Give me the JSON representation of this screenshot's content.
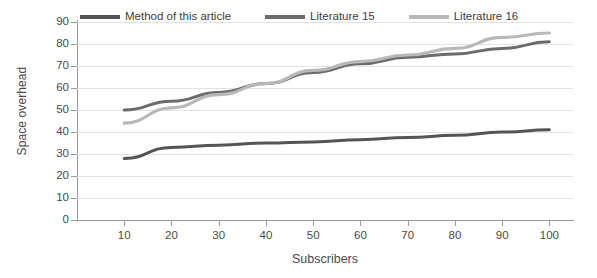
{
  "chart_data": {
    "type": "line",
    "title": "",
    "xlabel": "Subscribers",
    "ylabel": "Space overhead",
    "xlim": [
      0,
      105
    ],
    "ylim": [
      0,
      90
    ],
    "grid": true,
    "legend_position": "top",
    "x": [
      10,
      20,
      30,
      40,
      50,
      60,
      70,
      80,
      90,
      100
    ],
    "xticks": [
      "10",
      "20",
      "30",
      "40",
      "50",
      "60",
      "70",
      "80",
      "90",
      "100"
    ],
    "yticks": [
      "0",
      "10",
      "20",
      "30",
      "40",
      "50",
      "60",
      "70",
      "80",
      "90"
    ],
    "series": [
      {
        "name": "Method of this article",
        "color": "#545454",
        "values": [
          28,
          33,
          34,
          35,
          35.5,
          36.5,
          37.5,
          38.5,
          40,
          41
        ]
      },
      {
        "name": "Literature 15",
        "color": "#6b6b6b",
        "values": [
          50,
          54,
          58,
          62,
          67,
          71,
          74,
          75.5,
          78,
          81
        ]
      },
      {
        "name": "Literature 16",
        "color": "#b8b8b8",
        "values": [
          44,
          51,
          57,
          62,
          68,
          72,
          75,
          78,
          83,
          85
        ]
      }
    ]
  },
  "colors": {
    "axis": "#9a9a9a",
    "grid": "#e2e2e2",
    "text": "#4a4a4a",
    "background": "#ffffff"
  }
}
